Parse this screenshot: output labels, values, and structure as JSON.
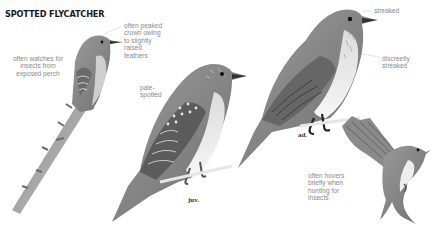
{
  "page": {
    "title": "SPOTTED FLYCATCHER",
    "species": "Spotted Flycatcher"
  },
  "annotations": [
    {
      "id": "perch",
      "text": "often watches for\ninsects from\nexposed perch"
    },
    {
      "id": "crown",
      "text": "often peaked\ncrown owing\nto slightly\nraised\nfeathers"
    },
    {
      "id": "pale-spotted",
      "text": "pale-\nspotted"
    },
    {
      "id": "streaked",
      "text": "streaked"
    },
    {
      "id": "discreetly-streaked",
      "text": "discreetly\nstreaked"
    },
    {
      "id": "hovers",
      "text": "often hovers\nbriefly when\nhunting for\ninsects"
    }
  ],
  "stage_labels": {
    "juvenile": "juv.",
    "adult": "ad."
  },
  "colors": {
    "title": "#1a1a1a",
    "note_text": "#8a8a8a",
    "leader_line": "#c8c8c8",
    "plumage_dark": "#5a5a5a",
    "plumage_mid": "#8c8c8c",
    "plumage_light": "#d8d8d8",
    "underparts": "#f0f0f0"
  }
}
